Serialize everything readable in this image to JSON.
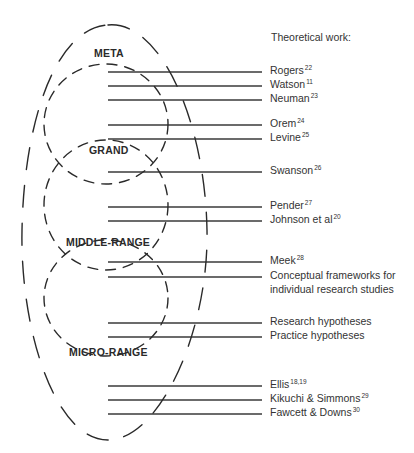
{
  "header": {
    "title": "Theoretical work:"
  },
  "levels": [
    {
      "label": "META"
    },
    {
      "label": "GRAND"
    },
    {
      "label": "MIDDLE-RANGE"
    },
    {
      "label": "MICRO-RANGE"
    }
  ],
  "works": [
    {
      "name": "Rogers",
      "ref": "22"
    },
    {
      "name": "Watson",
      "ref": "11"
    },
    {
      "name": "Neuman",
      "ref": "23"
    },
    {
      "name": "Orem",
      "ref": "24"
    },
    {
      "name": "Levine",
      "ref": "25"
    },
    {
      "name": "Swanson",
      "ref": "26"
    },
    {
      "name": "Pender",
      "ref": "27"
    },
    {
      "name": "Johnson et al",
      "ref": "20"
    },
    {
      "name": "Meek",
      "ref": "28"
    },
    {
      "name": "Conceptual frameworks for",
      "ref": ""
    },
    {
      "name": "individual research studies",
      "ref": ""
    },
    {
      "name": "Research hypotheses",
      "ref": ""
    },
    {
      "name": "Practice hypotheses",
      "ref": ""
    },
    {
      "name": "Ellis",
      "ref": "18,19"
    },
    {
      "name": "Kikuchi & Simmons",
      "ref": "29"
    },
    {
      "name": "Fawcett & Downs",
      "ref": "30"
    }
  ],
  "colors": {
    "line": "#3a3a3a",
    "text": "#333333",
    "background": "#ffffff"
  }
}
